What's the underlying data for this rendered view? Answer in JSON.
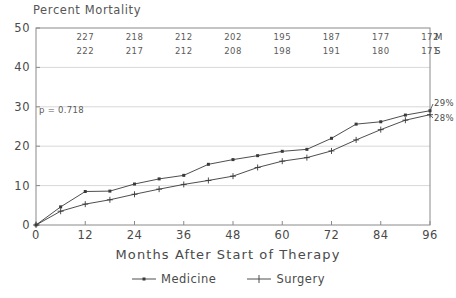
{
  "chart_data": {
    "type": "line",
    "title": "",
    "ylabel": "Percent Mortality",
    "xlabel": "Months After Start of Therapy",
    "xlim": [
      0,
      96
    ],
    "ylim": [
      0,
      50
    ],
    "xticks": [
      "0",
      "12",
      "24",
      "36",
      "48",
      "60",
      "72",
      "84",
      "96"
    ],
    "yticks": [
      "0",
      "10",
      "20",
      "30",
      "40",
      "50"
    ],
    "grid": true,
    "legend_position": "bottom-center",
    "annotations": {
      "pvalue": "p = 0.718",
      "end_medicine": "29%",
      "end_surgery": "28%"
    },
    "x": [
      0,
      6,
      12,
      18,
      24,
      30,
      36,
      42,
      48,
      54,
      60,
      66,
      72,
      78,
      84,
      90,
      96
    ],
    "series": [
      {
        "name": "Medicine",
        "marker": "filled-square",
        "values": [
          0,
          4.6,
          8.5,
          8.6,
          10.4,
          11.7,
          12.6,
          15.4,
          16.6,
          17.6,
          18.7,
          19.2,
          22.0,
          25.6,
          26.2,
          27.9,
          29.0
        ]
      },
      {
        "name": "Surgery",
        "marker": "plus",
        "values": [
          0,
          3.5,
          5.3,
          6.4,
          7.8,
          9.1,
          10.3,
          11.3,
          12.4,
          14.6,
          16.2,
          17.1,
          18.8,
          21.6,
          24.2,
          26.6,
          28.0
        ]
      }
    ]
  },
  "risk_table": {
    "columns": [
      "12",
      "24",
      "36",
      "48",
      "60",
      "72",
      "84",
      "96"
    ],
    "rows": [
      {
        "tag": "M",
        "counts": [
          "227",
          "218",
          "212",
          "202",
          "195",
          "187",
          "177",
          "172"
        ]
      },
      {
        "tag": "S",
        "counts": [
          "222",
          "217",
          "212",
          "208",
          "198",
          "191",
          "180",
          "171"
        ]
      }
    ]
  },
  "legend": {
    "items": [
      {
        "label": "Medicine",
        "marker": "filled-square"
      },
      {
        "label": "Surgery",
        "marker": "plus"
      }
    ]
  },
  "colors": {
    "line": "#3a3a3a",
    "grid": "#d8d8d8",
    "axis": "#8a8a8a",
    "text": "#4a4a4a",
    "background": "#ffffff"
  }
}
